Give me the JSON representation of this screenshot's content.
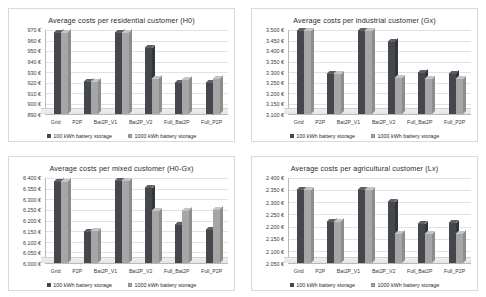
{
  "legend": {
    "series1_label": "100 kWh battery storage",
    "series2_label": "1000 kWh battery storage",
    "series1_color": "#44484d",
    "series2_color": "#a6a6a6"
  },
  "categories": [
    "Grid",
    "P2P",
    "Bat2P_V1",
    "Bat2P_V2",
    "Full_Bat2P",
    "Full_P2P"
  ],
  "chart_data": [
    {
      "type": "bar",
      "title": "Average costs per residential customer (H0)",
      "xlabel": "",
      "ylabel": "",
      "categories": [
        "Grid",
        "P2P",
        "Bat2P_V1",
        "Bat2P_V2",
        "Full_Bat2P",
        "Full_P2P"
      ],
      "ylim": [
        890,
        970
      ],
      "yticks": [
        890,
        900,
        910,
        920,
        930,
        940,
        950,
        960,
        970
      ],
      "ytick_labels": [
        "890 €",
        "900 €",
        "910 €",
        "920 €",
        "930 €",
        "940 €",
        "950 €",
        "960 €",
        "970 €"
      ],
      "grid": true,
      "legend_position": "bottom",
      "series": [
        {
          "name": "100 kWh battery storage",
          "values": [
            968,
            921,
            968,
            953,
            920,
            920
          ]
        },
        {
          "name": "1000 kWh battery storage",
          "values": [
            968,
            921,
            968,
            924,
            923,
            924
          ]
        }
      ]
    },
    {
      "type": "bar",
      "title": "Average costs per industrial customer (Gx)",
      "xlabel": "",
      "ylabel": "",
      "categories": [
        "Grid",
        "P2P",
        "Bat2P_V1",
        "Bat2P_V2",
        "Full_Bat2P",
        "Full_P2P"
      ],
      "ylim": [
        3.1,
        3.5
      ],
      "yticks": [
        3.1,
        3.15,
        3.2,
        3.25,
        3.3,
        3.35,
        3.4,
        3.45,
        3.5
      ],
      "ytick_labels": [
        "3.100 €",
        "3.150 €",
        "3.200 €",
        "3.250 €",
        "3.300 €",
        "3.350 €",
        "3.400 €",
        "3.450 €",
        "3.500 €"
      ],
      "grid": true,
      "legend_position": "bottom",
      "series": [
        {
          "name": "100 kWh battery storage",
          "values": [
            3.497,
            3.292,
            3.497,
            3.447,
            3.3,
            3.293
          ]
        },
        {
          "name": "1000 kWh battery storage",
          "values": [
            3.497,
            3.292,
            3.497,
            3.272,
            3.268,
            3.268
          ]
        }
      ]
    },
    {
      "type": "bar",
      "title": "Average costs per mixed customer (H0-Gx)",
      "xlabel": "",
      "ylabel": "",
      "categories": [
        "Grid",
        "P2P",
        "Bat2P_V1",
        "Bat2P_V2",
        "Full_Bat2P",
        "Full_P2P"
      ],
      "ylim": [
        6.0,
        6.4
      ],
      "yticks": [
        6.0,
        6.05,
        6.1,
        6.15,
        6.2,
        6.25,
        6.3,
        6.35,
        6.4
      ],
      "ytick_labels": [
        "6.000 €",
        "6.050 €",
        "6.100 €",
        "6.150 €",
        "6.200 €",
        "6.250 €",
        "6.300 €",
        "6.350 €",
        "6.400 €"
      ],
      "grid": true,
      "legend_position": "bottom",
      "series": [
        {
          "name": "100 kWh battery storage",
          "values": [
            6.385,
            6.15,
            6.388,
            6.355,
            6.18,
            6.16
          ]
        },
        {
          "name": "1000 kWh battery storage",
          "values": [
            6.385,
            6.152,
            6.388,
            6.247,
            6.248,
            6.252
          ]
        }
      ]
    },
    {
      "type": "bar",
      "title": "Average costs per agricultural customer (Lx)",
      "xlabel": "",
      "ylabel": "",
      "categories": [
        "Grid",
        "P2P",
        "Bat2P_V1",
        "Bat2P_V2",
        "Full_Bat2P",
        "Full_P2P"
      ],
      "ylim": [
        2.05,
        2.4
      ],
      "yticks": [
        2.05,
        2.1,
        2.15,
        2.2,
        2.25,
        2.3,
        2.35,
        2.4
      ],
      "ytick_labels": [
        "2.050 €",
        "2.100 €",
        "2.150 €",
        "2.200 €",
        "2.250 €",
        "2.300 €",
        "2.350 €",
        "2.400 €"
      ],
      "grid": true,
      "legend_position": "bottom",
      "series": [
        {
          "name": "100 kWh battery storage",
          "values": [
            2.352,
            2.222,
            2.352,
            2.302,
            2.212,
            2.215
          ]
        },
        {
          "name": "1000 kWh battery storage",
          "values": [
            2.352,
            2.222,
            2.352,
            2.172,
            2.17,
            2.172
          ]
        }
      ]
    }
  ]
}
